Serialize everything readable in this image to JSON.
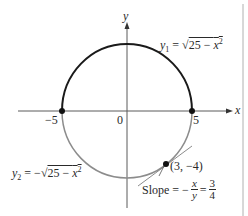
{
  "figure": {
    "type": "circle-implicit-differentiation",
    "equation_upper": {
      "lhs_var": "y",
      "lhs_sub": "1",
      "eq": "=",
      "radical": "√",
      "radicand_const": "25 − ",
      "radicand_var": "x",
      "radicand_exp": "2"
    },
    "equation_lower": {
      "lhs_var": "y",
      "lhs_sub": "2",
      "eq": "= −",
      "radical": "√",
      "radicand_const": "25 − ",
      "radicand_var": "x",
      "radicand_exp": "2"
    },
    "axes": {
      "x_label": "x",
      "y_label": "y",
      "origin_label": "0",
      "tick_neg5": "−5",
      "tick_pos5": "5"
    },
    "point": {
      "label": "(3, −4)",
      "x": 3,
      "y": -4
    },
    "slope": {
      "prefix": "Slope = −",
      "frac1_num": "x",
      "frac1_den": "y",
      "eq": "=",
      "frac2_num": "3",
      "frac2_den": "4"
    },
    "colors": {
      "upper_arc": "#1a1a1a",
      "lower_arc": "#8c8c8c",
      "axis": "#555555",
      "tangent": "#8c8c8c",
      "point": "#111111",
      "border": "#aaaaaa"
    },
    "radius": 5
  }
}
